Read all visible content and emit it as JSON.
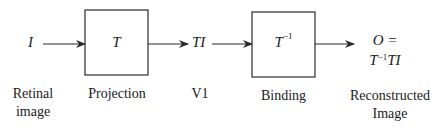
{
  "nodes": {
    "input": {
      "symbol": "I",
      "label_line1": "Retinal",
      "label_line2": "image"
    },
    "projection": {
      "symbol": "T",
      "label": "Projection"
    },
    "v1": {
      "symbol": "TI",
      "label": "V1"
    },
    "binding": {
      "symbol_base": "T",
      "symbol_sup": "−1",
      "label": "Binding"
    },
    "output": {
      "line1": "O =",
      "line2_base": "T",
      "line2_sup": "−1",
      "line2_rest": "TI",
      "label_line1": "Reconstructed",
      "label_line2": "Image"
    }
  },
  "colors": {
    "stroke": "#2a2a2a",
    "text": "#1a1a1a",
    "background": "#ffffff"
  }
}
